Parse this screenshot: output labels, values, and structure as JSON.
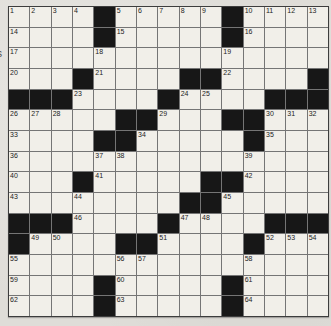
{
  "meta": {
    "kind": "crossword-grid",
    "rows": 15,
    "cols": 15,
    "last_number": 64
  },
  "colors": {
    "paper": "#dfddd8",
    "cell_background": "#f1efe9",
    "grid_line": "#757575",
    "outer_border": "#3d3d3d",
    "black_square": "#171717",
    "number_text": "#1c1c1c"
  },
  "margin_fragment": "s",
  "grid": {
    "layout": [
      "....#.....#....",
      "....#.....#....",
      "...............",
      "...#....##....#",
      "###....#....###",
      ".....##...##...",
      "....##.....#...",
      "...............",
      "...#.....##....",
      "........##.....",
      "###....#....###",
      "#....##....#...",
      "...............",
      "....#.....#....",
      "....#.....#...."
    ],
    "numbers": [
      {
        "r": 1,
        "c": 1,
        "n": "1"
      },
      {
        "r": 1,
        "c": 2,
        "n": "2"
      },
      {
        "r": 1,
        "c": 3,
        "n": "3"
      },
      {
        "r": 1,
        "c": 4,
        "n": "4"
      },
      {
        "r": 1,
        "c": 6,
        "n": "5"
      },
      {
        "r": 1,
        "c": 7,
        "n": "6"
      },
      {
        "r": 1,
        "c": 8,
        "n": "7"
      },
      {
        "r": 1,
        "c": 9,
        "n": "8"
      },
      {
        "r": 1,
        "c": 10,
        "n": "9"
      },
      {
        "r": 1,
        "c": 12,
        "n": "10"
      },
      {
        "r": 1,
        "c": 13,
        "n": "11"
      },
      {
        "r": 1,
        "c": 14,
        "n": "12"
      },
      {
        "r": 1,
        "c": 15,
        "n": "13"
      },
      {
        "r": 2,
        "c": 1,
        "n": "14"
      },
      {
        "r": 2,
        "c": 6,
        "n": "15"
      },
      {
        "r": 2,
        "c": 12,
        "n": "16"
      },
      {
        "r": 3,
        "c": 1,
        "n": "17"
      },
      {
        "r": 3,
        "c": 5,
        "n": "18"
      },
      {
        "r": 3,
        "c": 11,
        "n": "19"
      },
      {
        "r": 4,
        "c": 1,
        "n": "20"
      },
      {
        "r": 4,
        "c": 5,
        "n": "21"
      },
      {
        "r": 4,
        "c": 11,
        "n": "22"
      },
      {
        "r": 5,
        "c": 4,
        "n": "23"
      },
      {
        "r": 5,
        "c": 9,
        "n": "24"
      },
      {
        "r": 5,
        "c": 10,
        "n": "25"
      },
      {
        "r": 6,
        "c": 1,
        "n": "26"
      },
      {
        "r": 6,
        "c": 2,
        "n": "27"
      },
      {
        "r": 6,
        "c": 3,
        "n": "28"
      },
      {
        "r": 6,
        "c": 8,
        "n": "29"
      },
      {
        "r": 6,
        "c": 13,
        "n": "30"
      },
      {
        "r": 6,
        "c": 14,
        "n": "31"
      },
      {
        "r": 6,
        "c": 15,
        "n": "32"
      },
      {
        "r": 7,
        "c": 1,
        "n": "33"
      },
      {
        "r": 7,
        "c": 7,
        "n": "34"
      },
      {
        "r": 7,
        "c": 13,
        "n": "35"
      },
      {
        "r": 8,
        "c": 1,
        "n": "36"
      },
      {
        "r": 8,
        "c": 5,
        "n": "37"
      },
      {
        "r": 8,
        "c": 6,
        "n": "38"
      },
      {
        "r": 8,
        "c": 12,
        "n": "39"
      },
      {
        "r": 9,
        "c": 1,
        "n": "40"
      },
      {
        "r": 9,
        "c": 5,
        "n": "41"
      },
      {
        "r": 9,
        "c": 12,
        "n": "42"
      },
      {
        "r": 10,
        "c": 1,
        "n": "43"
      },
      {
        "r": 10,
        "c": 4,
        "n": "44"
      },
      {
        "r": 10,
        "c": 11,
        "n": "45"
      },
      {
        "r": 11,
        "c": 4,
        "n": "46"
      },
      {
        "r": 11,
        "c": 9,
        "n": "47"
      },
      {
        "r": 11,
        "c": 10,
        "n": "48"
      },
      {
        "r": 12,
        "c": 2,
        "n": "49"
      },
      {
        "r": 12,
        "c": 3,
        "n": "50"
      },
      {
        "r": 12,
        "c": 8,
        "n": "51"
      },
      {
        "r": 12,
        "c": 13,
        "n": "52"
      },
      {
        "r": 12,
        "c": 14,
        "n": "53"
      },
      {
        "r": 12,
        "c": 15,
        "n": "54"
      },
      {
        "r": 13,
        "c": 1,
        "n": "55"
      },
      {
        "r": 13,
        "c": 6,
        "n": "56"
      },
      {
        "r": 13,
        "c": 7,
        "n": "57"
      },
      {
        "r": 13,
        "c": 12,
        "n": "58"
      },
      {
        "r": 14,
        "c": 1,
        "n": "59"
      },
      {
        "r": 14,
        "c": 6,
        "n": "60"
      },
      {
        "r": 14,
        "c": 12,
        "n": "61"
      },
      {
        "r": 15,
        "c": 1,
        "n": "62"
      },
      {
        "r": 15,
        "c": 6,
        "n": "63"
      },
      {
        "r": 15,
        "c": 12,
        "n": "64"
      }
    ]
  }
}
